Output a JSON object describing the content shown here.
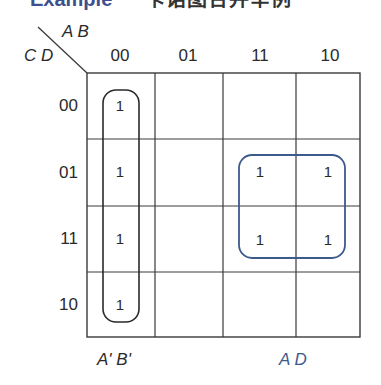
{
  "title": {
    "left_fragment": "Example",
    "right_fragment": "卡诺图合并举例"
  },
  "kmap": {
    "col_var_label": "A B",
    "row_var_label": "C D",
    "col_headers": [
      "00",
      "01",
      "11",
      "10"
    ],
    "row_headers": [
      "00",
      "01",
      "11",
      "10"
    ],
    "cells": [
      [
        "1",
        "",
        "",
        ""
      ],
      [
        "1",
        "",
        "1",
        "1"
      ],
      [
        "1",
        "",
        "1",
        "1"
      ],
      [
        "1",
        "",
        "",
        ""
      ]
    ],
    "groups": [
      {
        "term": "A' B'",
        "color": "#2a2a2a",
        "covers": "column 00, rows 00-10"
      },
      {
        "term": "A D",
        "color": "#3d5a8c",
        "covers": "columns 11-10, rows 01-11"
      }
    ]
  },
  "colors": {
    "grid": "#3a3a3a",
    "text": "#2a2a2a",
    "group_blue": "#3d5a8c",
    "background": "#ffffff"
  }
}
